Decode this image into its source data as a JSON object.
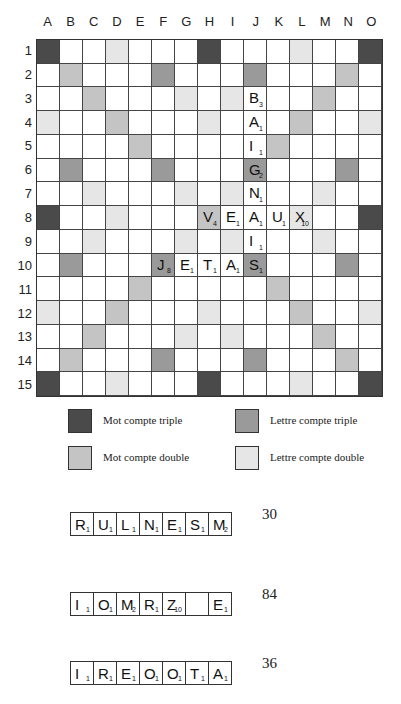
{
  "board": {
    "columns": [
      "A",
      "B",
      "C",
      "D",
      "E",
      "F",
      "G",
      "H",
      "I",
      "J",
      "K",
      "L",
      "M",
      "N",
      "O"
    ],
    "rows": [
      "1",
      "2",
      "3",
      "4",
      "5",
      "6",
      "7",
      "8",
      "9",
      "10",
      "11",
      "12",
      "13",
      "14",
      "15"
    ],
    "premiums": {
      "tw": [
        "A1",
        "H1",
        "O1",
        "A8",
        "O8",
        "A15",
        "H15",
        "O15"
      ],
      "tl": [
        "F2",
        "J2",
        "B6",
        "F6",
        "J6",
        "N6",
        "B10",
        "F10",
        "J10",
        "N10",
        "F14",
        "J14"
      ],
      "dw": [
        "B2",
        "N2",
        "C3",
        "M3",
        "D4",
        "L4",
        "E5",
        "K5",
        "H8",
        "E11",
        "K11",
        "D12",
        "L12",
        "C13",
        "M13",
        "B14",
        "N14"
      ],
      "dl": [
        "D1",
        "L1",
        "G3",
        "I3",
        "A4",
        "H4",
        "O4",
        "C7",
        "G7",
        "I7",
        "M7",
        "D8",
        "L8",
        "C9",
        "G9",
        "I9",
        "M9",
        "A12",
        "H12",
        "O12",
        "G13",
        "I13",
        "D15",
        "L15"
      ]
    },
    "tiles": [
      {
        "pos": "J3",
        "letter": "B",
        "score": "3"
      },
      {
        "pos": "J4",
        "letter": "A",
        "score": "1"
      },
      {
        "pos": "J5",
        "letter": "I",
        "score": "1"
      },
      {
        "pos": "J6",
        "letter": "G",
        "score": "2"
      },
      {
        "pos": "J7",
        "letter": "N",
        "score": "1"
      },
      {
        "pos": "H8",
        "letter": "V",
        "score": "4"
      },
      {
        "pos": "I8",
        "letter": "E",
        "score": "1"
      },
      {
        "pos": "J8",
        "letter": "A",
        "score": "1"
      },
      {
        "pos": "K8",
        "letter": "U",
        "score": "1"
      },
      {
        "pos": "L8",
        "letter": "X",
        "score": "10"
      },
      {
        "pos": "J9",
        "letter": "I",
        "score": "1"
      },
      {
        "pos": "F10",
        "letter": "J",
        "score": "8"
      },
      {
        "pos": "G10",
        "letter": "E",
        "score": "1"
      },
      {
        "pos": "H10",
        "letter": "T",
        "score": "1"
      },
      {
        "pos": "I10",
        "letter": "A",
        "score": "1"
      },
      {
        "pos": "J10",
        "letter": "S",
        "score": "1"
      }
    ]
  },
  "colors": {
    "tw": "#4a4a4a",
    "tl": "#9a9a9a",
    "dw": "#c4c4c4",
    "dl": "#e6e6e6"
  },
  "legend": {
    "tw": "Mot compte triple",
    "tl": "Lettre compte triple",
    "dw": "Mot compte double",
    "dl": "Lettre compte double"
  },
  "racks": [
    {
      "tiles": [
        {
          "letter": "R",
          "score": "1"
        },
        {
          "letter": "U",
          "score": "1"
        },
        {
          "letter": "L",
          "score": "1"
        },
        {
          "letter": "N",
          "score": "1"
        },
        {
          "letter": "E",
          "score": "1"
        },
        {
          "letter": "S",
          "score": "1"
        },
        {
          "letter": "M",
          "score": "2"
        }
      ],
      "points": "30"
    },
    {
      "tiles": [
        {
          "letter": "I",
          "score": "1"
        },
        {
          "letter": "O",
          "score": "1"
        },
        {
          "letter": "M",
          "score": "2"
        },
        {
          "letter": "R",
          "score": "1"
        },
        {
          "letter": "Z",
          "score": "10"
        },
        {
          "letter": "",
          "score": ""
        },
        {
          "letter": "E",
          "score": "1"
        }
      ],
      "points": "84"
    },
    {
      "tiles": [
        {
          "letter": "I",
          "score": "1"
        },
        {
          "letter": "R",
          "score": "1"
        },
        {
          "letter": "E",
          "score": "1"
        },
        {
          "letter": "O",
          "score": "1"
        },
        {
          "letter": "O",
          "score": "1"
        },
        {
          "letter": "T",
          "score": "1"
        },
        {
          "letter": "A",
          "score": "1"
        }
      ],
      "points": "36"
    }
  ]
}
